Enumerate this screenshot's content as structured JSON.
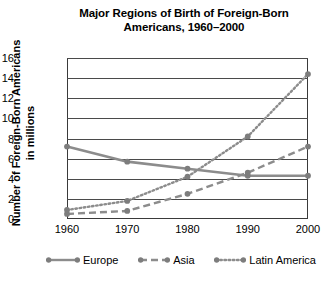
{
  "chart_data": {
    "type": "line",
    "title": "Major Regions of Birth of Foreign-Born Americans, 1960–2000",
    "title_line1": "Major Regions of Birth of Foreign-Born",
    "title_line2": "Americans, 1960–2000",
    "xlabel": "",
    "ylabel": "Number of Foreign-Born Americans in millions",
    "ylabel_line1": "Number of Foreign-Born Americans",
    "ylabel_line2": "in millions",
    "categories": [
      "1960",
      "1970",
      "1980",
      "1990",
      "2000"
    ],
    "x": [
      1960,
      1970,
      1980,
      1990,
      2000
    ],
    "xtick_labels": [
      "1960",
      "1970",
      "1980",
      "1990",
      "2000"
    ],
    "ytick_labels": [
      "0",
      "2",
      "4",
      "6",
      "8",
      "10",
      "12",
      "14",
      "16"
    ],
    "yticks": [
      0,
      2,
      4,
      6,
      8,
      10,
      12,
      14,
      16
    ],
    "ylim": [
      0,
      16
    ],
    "grid": "horizontal",
    "legend_position": "bottom",
    "series": [
      {
        "name": "Europe",
        "style": "solid",
        "color": "#8c8c8c",
        "values": [
          7.2,
          5.7,
          5.0,
          4.3,
          4.3
        ]
      },
      {
        "name": "Asia",
        "style": "dashed",
        "color": "#8c8c8c",
        "values": [
          0.5,
          0.8,
          2.5,
          4.6,
          7.2
        ]
      },
      {
        "name": "Latin America",
        "style": "dotted",
        "color": "#8c8c8c",
        "values": [
          0.9,
          1.8,
          4.2,
          8.2,
          14.4
        ]
      }
    ]
  },
  "legend": {
    "items": [
      {
        "label": "Europe",
        "style": "solid"
      },
      {
        "label": "Asia",
        "style": "dashed"
      },
      {
        "label": "Latin America",
        "style": "dotted"
      }
    ]
  },
  "colors": {
    "series": "#8c8c8c",
    "marker": "#7d7d7d",
    "axis": "#3a3a3a",
    "grid": "#4a4a4a",
    "text": "#000000",
    "background": "#ffffff"
  }
}
